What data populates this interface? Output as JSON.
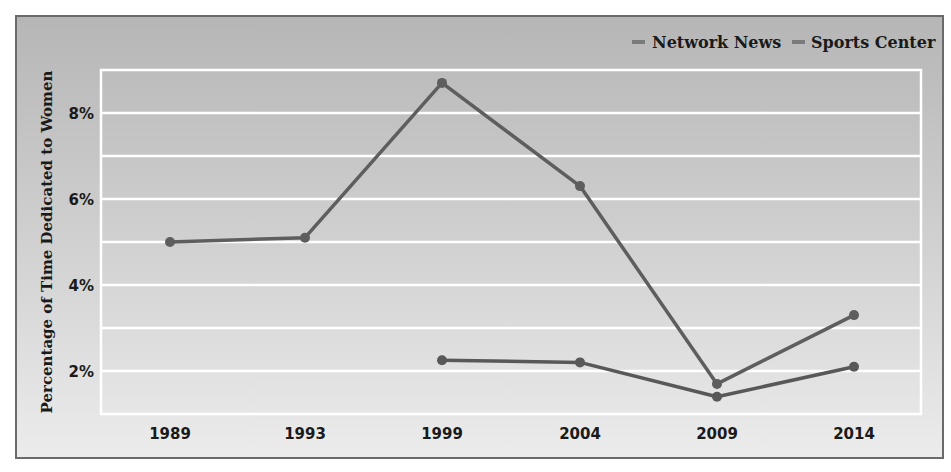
{
  "chart_data": {
    "type": "line",
    "title": "",
    "xlabel": "",
    "ylabel": "Percentage of Time Dedicated to Women",
    "categories": [
      "1989",
      "1993",
      "1999",
      "2004",
      "2009",
      "2014"
    ],
    "series": [
      {
        "name": "Network News",
        "values": [
          5.0,
          5.1,
          8.7,
          6.3,
          1.7,
          3.3
        ],
        "color": "#5e5e5e"
      },
      {
        "name": "Sports Center",
        "values": [
          null,
          null,
          2.25,
          2.2,
          1.4,
          2.1
        ],
        "color": "#585858"
      }
    ],
    "yticks": [
      "2%",
      "4%",
      "6%",
      "8%"
    ],
    "ytick_values": [
      2,
      4,
      6,
      8
    ],
    "ylim": [
      1,
      9
    ],
    "grid": true,
    "grid_step": 1,
    "legend_position": "top-right"
  },
  "legend": {
    "items": [
      {
        "label": "Network News",
        "color": "#7a7a7a"
      },
      {
        "label": "Sports Center",
        "color": "#7a7a7a"
      }
    ]
  },
  "colors": {
    "gridline": "#ffffff",
    "frame_border": "#6a6a6a",
    "background_top": "#b6b6b6",
    "background_bottom": "#ececec"
  }
}
